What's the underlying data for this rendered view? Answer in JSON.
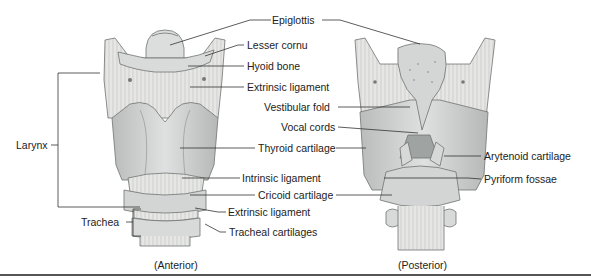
{
  "figure": {
    "views": {
      "anterior": "(Anterior)",
      "posterior": "(Posterior)"
    },
    "brackets": {
      "larynx": "Larynx",
      "trachea": "Trachea"
    },
    "labels": {
      "epiglottis": "Epiglottis",
      "lesser_cornu": "Lesser cornu",
      "hyoid_bone": "Hyoid bone",
      "extrinsic_ligament_upper": "Extrinsic ligament",
      "vestibular_fold": "Vestibular fold",
      "vocal_cords": "Vocal cords",
      "thyroid_cartilage": "Thyroid cartilage",
      "intrinsic_ligament": "Intrinsic ligament",
      "cricoid_cartilage": "Cricoid cartilage",
      "extrinsic_ligament_lower": "Extrinsic ligament",
      "tracheal_cartilages": "Tracheal cartilages",
      "arytenoid_cartilage": "Arytenoid cartilage",
      "pyriform_fossae": "Pyriform fossae"
    },
    "colors": {
      "cartilage_fill": "#d6d8d7",
      "cartilage_shade": "#b7bab9",
      "ligament_fill": "#e4e5e3",
      "outline": "#6f7371",
      "leader_line": "#333333",
      "rule": "#555555"
    }
  }
}
